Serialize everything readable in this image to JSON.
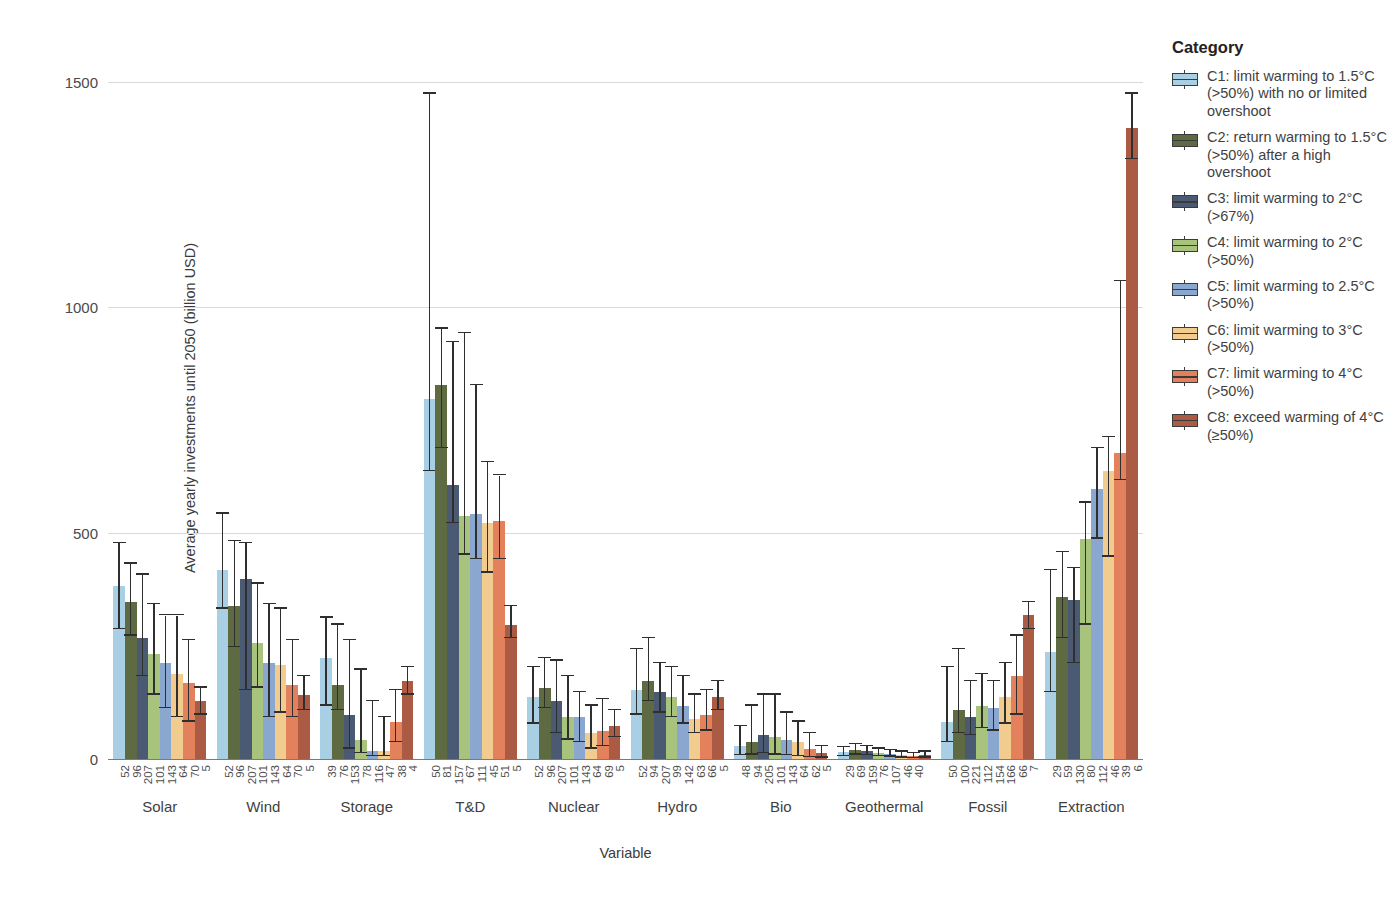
{
  "legend": {
    "title": "Category",
    "items": [
      {
        "id": "C1",
        "label": "C1: limit warming to 1.5°C (>50%) with no or limited overshoot",
        "color": "#a8cfe3"
      },
      {
        "id": "C2",
        "label": "C2: return warming to 1.5°C (>50%) after a high overshoot",
        "color": "#5e6b42"
      },
      {
        "id": "C3",
        "label": "C3: limit warming to 2°C (>67%)",
        "color": "#4a5a72"
      },
      {
        "id": "C4",
        "label": "C4: limit warming to 2°C (>50%)",
        "color": "#a8c47c"
      },
      {
        "id": "C5",
        "label": "C5: limit warming to 2.5°C (>50%)",
        "color": "#8aa8cf"
      },
      {
        "id": "C6",
        "label": "C6: limit warming to 3°C (>50%)",
        "color": "#f2cb8f"
      },
      {
        "id": "C7",
        "label": "C7: limit warming to 4°C (>50%)",
        "color": "#e2815c"
      },
      {
        "id": "C8",
        "label": "C8: exceed warming of 4°C (≥50%)",
        "color": "#ab5a43"
      }
    ]
  },
  "chart_data": {
    "type": "bar",
    "title": "",
    "xlabel": "Variable",
    "ylabel": "Average yearly investments until 2050 (billion USD)",
    "ylim": [
      0,
      1550
    ],
    "yticks": [
      0,
      500,
      1000,
      1500
    ],
    "grid": true,
    "legend_position": "right",
    "categories": [
      "Solar",
      "Wind",
      "Storage",
      "T&D",
      "Nuclear",
      "Hydro",
      "Bio",
      "Geothermal",
      "Fossil",
      "Extraction"
    ],
    "series": [
      {
        "name": "C1",
        "color": "#a8cfe3",
        "values": [
          385,
          420,
          225,
          800,
          140,
          155,
          30,
          18,
          85,
          240
        ],
        "err_low": [
          290,
          335,
          120,
          640,
          80,
          100,
          10,
          8,
          40,
          150
        ],
        "err_high": [
          480,
          545,
          315,
          1475,
          205,
          245,
          75,
          28,
          205,
          420
        ]
      },
      {
        "name": "C2",
        "color": "#5e6b42",
        "values": [
          350,
          340,
          165,
          830,
          160,
          175,
          40,
          22,
          110,
          360
        ],
        "err_low": [
          275,
          250,
          110,
          690,
          115,
          130,
          12,
          12,
          60,
          270
        ],
        "err_high": [
          435,
          485,
          300,
          955,
          225,
          270,
          120,
          35,
          245,
          460
        ]
      },
      {
        "name": "C3",
        "color": "#4a5a72",
        "values": [
          270,
          400,
          100,
          610,
          130,
          150,
          55,
          20,
          95,
          355
        ],
        "err_low": [
          185,
          155,
          25,
          525,
          60,
          105,
          15,
          10,
          55,
          215
        ],
        "err_high": [
          410,
          480,
          265,
          925,
          220,
          215,
          145,
          30,
          175,
          425
        ]
      },
      {
        "name": "C4",
        "color": "#a8c47c",
        "values": [
          235,
          260,
          45,
          540,
          95,
          140,
          50,
          16,
          120,
          490
        ],
        "err_low": [
          145,
          160,
          15,
          455,
          45,
          95,
          12,
          8,
          70,
          300
        ],
        "err_high": [
          345,
          390,
          200,
          945,
          185,
          205,
          145,
          25,
          190,
          570
        ]
      },
      {
        "name": "C5",
        "color": "#8aa8cf",
        "values": [
          215,
          215,
          20,
          545,
          95,
          120,
          45,
          13,
          115,
          600
        ],
        "err_low": [
          115,
          95,
          8,
          445,
          40,
          80,
          10,
          7,
          65,
          490
        ],
        "err_high": [
          320,
          345,
          130,
          830,
          150,
          185,
          105,
          22,
          175,
          690
        ]
      },
      {
        "name": "C6",
        "color": "#f2cb8f",
        "values": [
          190,
          210,
          20,
          525,
          60,
          90,
          40,
          10,
          140,
          640
        ],
        "err_low": [
          95,
          105,
          8,
          415,
          25,
          60,
          8,
          5,
          80,
          450
        ],
        "err_high": [
          320,
          335,
          95,
          660,
          120,
          145,
          85,
          18,
          215,
          715
        ]
      },
      {
        "name": "C7",
        "color": "#e2815c",
        "values": [
          170,
          165,
          85,
          530,
          65,
          100,
          25,
          8,
          185,
          680
        ],
        "err_low": [
          85,
          95,
          40,
          445,
          30,
          65,
          6,
          4,
          100,
          620
        ],
        "err_high": [
          265,
          265,
          155,
          630,
          135,
          155,
          60,
          15,
          275,
          1060
        ]
      },
      {
        "name": "C8",
        "color": "#ab5a43",
        "values": [
          130,
          145,
          175,
          300,
          75,
          140,
          15,
          10,
          320,
          1400
        ],
        "err_low": [
          100,
          110,
          145,
          270,
          50,
          110,
          5,
          5,
          290,
          1330
        ],
        "err_high": [
          160,
          185,
          205,
          340,
          110,
          175,
          30,
          18,
          350,
          1475
        ]
      }
    ],
    "bar_tick_labels": [
      [
        52,
        96,
        207,
        101,
        143,
        64,
        70,
        5
      ],
      [
        52,
        96,
        207,
        101,
        143,
        64,
        70,
        5
      ],
      [
        39,
        76,
        153,
        78,
        116,
        47,
        38,
        4
      ],
      [
        50,
        81,
        157,
        67,
        111,
        45,
        51,
        5
      ],
      [
        52,
        96,
        207,
        101,
        143,
        64,
        69,
        5
      ],
      [
        52,
        94,
        207,
        99,
        142,
        63,
        66,
        5
      ],
      [
        48,
        94,
        205,
        101,
        143,
        64,
        62,
        5
      ],
      [
        29,
        69,
        159,
        76,
        107,
        46,
        40
      ],
      [
        50,
        100,
        221,
        112,
        154,
        166,
        66,
        7
      ],
      [
        29,
        59,
        130,
        80,
        112,
        46,
        39,
        6
      ]
    ]
  }
}
